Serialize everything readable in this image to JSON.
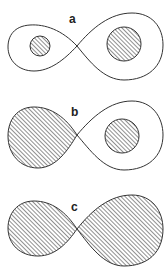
{
  "figure": {
    "panels": [
      {
        "label": "a",
        "left_lobe": "unshaded",
        "right_lobe": "unshaded",
        "left_inner_disk": "shaded",
        "right_inner_disk": "shaded"
      },
      {
        "label": "b",
        "left_lobe": "shaded",
        "right_lobe": "unshaded",
        "right_inner_disk": "shaded"
      },
      {
        "label": "c",
        "left_lobe": "shaded",
        "right_lobe": "shaded"
      }
    ],
    "colors": {
      "stroke": "#333333",
      "hatch": "#555555",
      "background": "#ffffff"
    }
  }
}
